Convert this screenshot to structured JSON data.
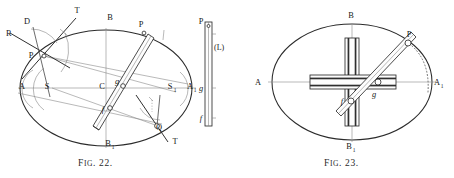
{
  "plate": {
    "width": 454,
    "height": 178,
    "background": "#ffffff",
    "ink": "#1a1a1a",
    "hairline": "#8d8d8d",
    "figures": [
      {
        "id": "fig-22",
        "caption_prefix": "F",
        "caption_smallcaps": "IG",
        "caption_suffix": ". 22.",
        "caption_full": "FIG. 22.",
        "description": "Elliptic trammel construction: ellipse with axes AA1 and BB1, centre C, trammel rod through points P and Q with slider pins f and g, tangent line T-T at P, normal R-D, auxiliary points S and S1, and a separate straight trammel scale (L).",
        "labels": [
          {
            "name": "label-T-upper",
            "text": "T",
            "x": 77,
            "y": 13,
            "sub": ""
          },
          {
            "name": "label-D",
            "text": "D",
            "x": 27,
            "y": 24,
            "sub": ""
          },
          {
            "name": "label-R",
            "text": "R",
            "x": 6,
            "y": 36,
            "sub": ""
          },
          {
            "name": "label-P-left",
            "text": "P",
            "x": 31,
            "y": 58,
            "sub": ""
          },
          {
            "name": "label-B-top",
            "text": "B",
            "x": 110,
            "y": 20,
            "sub": ""
          },
          {
            "name": "label-P-upper-right",
            "text": "P",
            "x": 141,
            "y": 27,
            "sub": ""
          },
          {
            "name": "label-A-left",
            "text": "A",
            "x": 22,
            "y": 89,
            "sub": ""
          },
          {
            "name": "label-S-left",
            "text": "S",
            "x": 47,
            "y": 89,
            "sub": ""
          },
          {
            "name": "label-C-centre",
            "text": "C",
            "x": 102,
            "y": 89,
            "sub": ""
          },
          {
            "name": "label-g",
            "text": "g",
            "x": 117,
            "y": 84,
            "sub": ""
          },
          {
            "name": "label-f",
            "text": "f",
            "x": 103,
            "y": 112,
            "sub": ""
          },
          {
            "name": "label-S1",
            "text": "S",
            "x": 170,
            "y": 89,
            "sub": "1"
          },
          {
            "name": "label-A1",
            "text": "A",
            "x": 190,
            "y": 89,
            "sub": "1"
          },
          {
            "name": "label-Q",
            "text": "Q",
            "x": 159,
            "y": 130,
            "sub": ""
          },
          {
            "name": "label-T-lower",
            "text": "T",
            "x": 175,
            "y": 144,
            "sub": ""
          },
          {
            "name": "label-B1",
            "text": "B",
            "x": 110,
            "y": 146,
            "sub": "1"
          },
          {
            "name": "label-P-scale",
            "text": "P",
            "x": 201,
            "y": 24,
            "sub": ""
          },
          {
            "name": "label-L-scale",
            "text": "(L)",
            "x": 214,
            "y": 47,
            "sub": ""
          },
          {
            "name": "label-g-scale",
            "text": "g",
            "x": 202,
            "y": 89,
            "sub": ""
          },
          {
            "name": "label-f-scale",
            "text": "f",
            "x": 202,
            "y": 119,
            "sub": ""
          }
        ]
      },
      {
        "id": "fig-23",
        "caption_prefix": "F",
        "caption_smallcaps": "IG",
        "caption_suffix": ". 23.",
        "caption_full": "FIG. 23.",
        "description": "Elliptic trammel instrument: ellipse with axes AA1 and BB1, a cross of two slotted guide bars along the axes, and the trammel rod carrying pins f and g with tracing point P, with a dotted arc showing the path of P.",
        "labels": [
          {
            "name": "label-B-top",
            "text": "B",
            "x": 351,
            "y": 18,
            "sub": ""
          },
          {
            "name": "label-P",
            "text": "P",
            "x": 409,
            "y": 37,
            "sub": ""
          },
          {
            "name": "label-A-left",
            "text": "A",
            "x": 258,
            "y": 82,
            "sub": ""
          },
          {
            "name": "label-A1",
            "text": "A",
            "x": 434,
            "y": 82,
            "sub": "1"
          },
          {
            "name": "label-g",
            "text": "g",
            "x": 374,
            "y": 95,
            "sub": ""
          },
          {
            "name": "label-f",
            "text": "f",
            "x": 343,
            "y": 105,
            "sub": ""
          },
          {
            "name": "label-B1",
            "text": "B",
            "x": 351,
            "y": 147,
            "sub": "1"
          }
        ]
      }
    ]
  }
}
